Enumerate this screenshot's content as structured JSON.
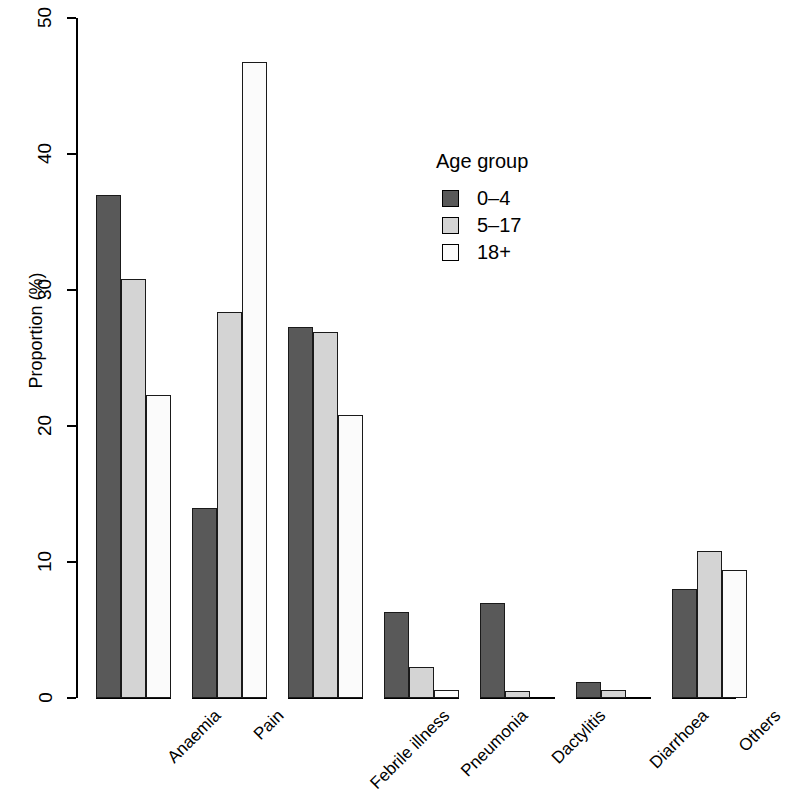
{
  "chart_data": {
    "type": "bar",
    "title": "",
    "xlabel": "",
    "ylabel": "Proportion (%)",
    "ylim": [
      0,
      50
    ],
    "y_ticks": [
      0,
      10,
      20,
      30,
      40,
      50
    ],
    "grid": false,
    "grouped": true,
    "bar_mode": "grouped",
    "categories": [
      "Anaemia",
      "Pain",
      "Febrile illness",
      "Pneumonia",
      "Dactylitis",
      "Diarrhoea",
      "Others"
    ],
    "legend": {
      "title": "Age group",
      "position": "top-right-inside",
      "entries": [
        {
          "name": "0–4",
          "color": "#595959"
        },
        {
          "name": "5–17",
          "color": "#d4d4d4"
        },
        {
          "name": "18+",
          "color": "#fbfbfb"
        }
      ]
    },
    "series": [
      {
        "name": "0–4",
        "color": "#595959",
        "values": [
          37.0,
          14.0,
          27.3,
          6.3,
          7.0,
          1.2,
          8.0
        ]
      },
      {
        "name": "5–17",
        "color": "#d4d4d4",
        "values": [
          30.8,
          28.4,
          26.9,
          2.3,
          0.5,
          0.6,
          10.8
        ]
      },
      {
        "name": "18+",
        "color": "#fbfbfb",
        "values": [
          22.3,
          46.8,
          20.8,
          0.6,
          0.0,
          0.0,
          9.4
        ]
      }
    ]
  },
  "axis": {
    "y_tick_labels": [
      "0",
      "10",
      "20",
      "30",
      "40",
      "50"
    ],
    "y_title": "Proportion (%)"
  }
}
